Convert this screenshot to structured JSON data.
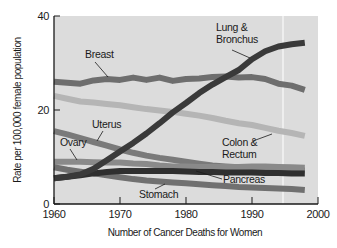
{
  "chart_data": {
    "type": "line",
    "title": "",
    "xlabel": "Number of Cancer Deaths for Women",
    "ylabel": "Rate per 100,000 female population",
    "xlim": [
      1960,
      2000
    ],
    "ylim": [
      0,
      40
    ],
    "x_ticks": [
      "1960",
      "1970",
      "1980",
      "1990",
      "2000"
    ],
    "y_ticks": [
      "0",
      "20",
      "40"
    ],
    "grid": false,
    "legend": "inline labels",
    "x": [
      1960,
      1962,
      1964,
      1966,
      1968,
      1970,
      1972,
      1974,
      1976,
      1978,
      1980,
      1982,
      1984,
      1986,
      1988,
      1990,
      1992,
      1994,
      1996,
      1998
    ],
    "series": [
      {
        "name": "Lung & Bronchus",
        "label": [
          "Lung &",
          "Bronchus"
        ],
        "color": "#3a3a3a",
        "values": [
          5.5,
          5.8,
          6.3,
          7.5,
          9.3,
          11.2,
          13.0,
          15.0,
          17.2,
          19.5,
          21.5,
          23.6,
          25.4,
          27.0,
          28.5,
          30.8,
          32.5,
          33.5,
          34.0,
          34.3
        ]
      },
      {
        "name": "Breast",
        "label": [
          "Breast"
        ],
        "color": "#6e6e6e",
        "values": [
          26.0,
          25.8,
          25.6,
          26.3,
          26.6,
          26.4,
          26.9,
          26.4,
          26.9,
          26.2,
          26.6,
          26.7,
          27.0,
          27.1,
          26.9,
          27.0,
          26.6,
          25.6,
          25.2,
          24.3
        ]
      },
      {
        "name": "Colon & Rectum",
        "label": [
          "Colon &",
          "Rectum"
        ],
        "color": "#b5b5b5",
        "values": [
          23.0,
          22.4,
          21.8,
          21.6,
          21.3,
          21.0,
          20.6,
          20.2,
          19.9,
          19.6,
          19.2,
          18.8,
          18.3,
          17.7,
          17.2,
          16.8,
          16.2,
          15.6,
          15.1,
          14.5
        ]
      },
      {
        "name": "Uterus",
        "label": [
          "Uterus"
        ],
        "color": "#7a7a7a",
        "values": [
          15.5,
          14.8,
          14.0,
          13.2,
          12.4,
          11.6,
          10.9,
          10.3,
          9.8,
          9.4,
          9.0,
          8.6,
          8.2,
          8.0,
          7.8,
          7.6,
          7.5,
          7.4,
          7.3,
          7.1
        ]
      },
      {
        "name": "Ovary",
        "label": [
          "Ovary"
        ],
        "color": "#8a8a8a",
        "values": [
          9.0,
          9.0,
          9.0,
          8.9,
          8.8,
          8.8,
          8.6,
          8.5,
          8.2,
          8.0,
          8.0,
          7.9,
          7.9,
          7.9,
          7.9,
          8.0,
          8.0,
          7.9,
          7.8,
          7.7
        ]
      },
      {
        "name": "Pancreas",
        "label": [
          "Pancreas"
        ],
        "color": "#2f2f2f",
        "values": [
          5.5,
          5.8,
          6.1,
          6.5,
          6.8,
          7.0,
          7.0,
          7.0,
          7.0,
          7.0,
          6.9,
          6.8,
          6.8,
          6.7,
          6.7,
          6.7,
          6.6,
          6.6,
          6.5,
          6.5
        ]
      },
      {
        "name": "Stomach",
        "label": [
          "Stomach"
        ],
        "color": "#707070",
        "values": [
          7.8,
          7.3,
          6.9,
          6.5,
          6.1,
          5.7,
          5.3,
          5.0,
          4.8,
          4.6,
          4.4,
          4.2,
          4.0,
          3.8,
          3.6,
          3.5,
          3.4,
          3.3,
          3.2,
          3.0
        ]
      }
    ],
    "annotations": [
      {
        "text": "vertical light reference line",
        "x": 1995
      }
    ]
  }
}
